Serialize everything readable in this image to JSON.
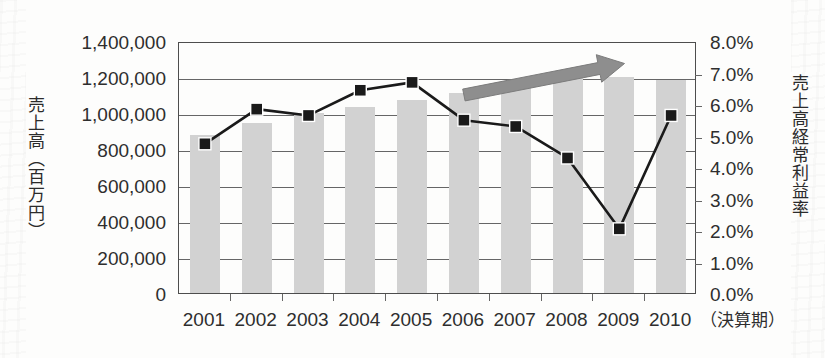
{
  "chart_data": {
    "type": "bar",
    "title": "",
    "subtitle": "",
    "categories": [
      "2001",
      "2002",
      "2003",
      "2004",
      "2005",
      "2006",
      "2007",
      "2008",
      "2009",
      "2010"
    ],
    "xlabel": "（決算期）",
    "grid": true,
    "legend_position": "none",
    "series": [
      {
        "name": "売上高（百万円）",
        "type": "bar",
        "axis": "left",
        "color": "#d2d2d2",
        "values": [
          880000,
          945000,
          1000000,
          1035000,
          1070000,
          1110000,
          1160000,
          1210000,
          1200000,
          1185000
        ]
      },
      {
        "name": "売上高経常利益率",
        "type": "line",
        "axis": "right",
        "color": "#1a1a1a",
        "marker": "square",
        "values": [
          4.8,
          5.9,
          5.7,
          6.5,
          6.75,
          5.55,
          5.35,
          4.35,
          2.1,
          5.7
        ]
      }
    ],
    "left_axis": {
      "label": "売上高（百万円）",
      "min": 0,
      "max": 1400000,
      "step": 200000,
      "ticks": [
        "0",
        "200,000",
        "400,000",
        "600,000",
        "800,000",
        "1,000,000",
        "1,200,000",
        "1,400,000"
      ],
      "tick_values": [
        0,
        200000,
        400000,
        600000,
        800000,
        1000000,
        1200000,
        1400000
      ]
    },
    "right_axis": {
      "label": "売上高経常利益率",
      "min": 0,
      "max": 8,
      "step": 1,
      "ticks": [
        "0.0%",
        "1.0%",
        "2.0%",
        "3.0%",
        "4.0%",
        "5.0%",
        "6.0%",
        "7.0%",
        "8.0%"
      ],
      "tick_values": [
        0,
        1,
        2,
        3,
        4,
        5,
        6,
        7,
        8
      ]
    },
    "annotations": [
      {
        "name": "growth-trend-arrow",
        "type": "arrow",
        "color": "#8e8e8e",
        "from_x": 5.0,
        "from_y_pct": 6.35,
        "to_x": 8.1,
        "to_y_pct": 7.35
      }
    ]
  }
}
